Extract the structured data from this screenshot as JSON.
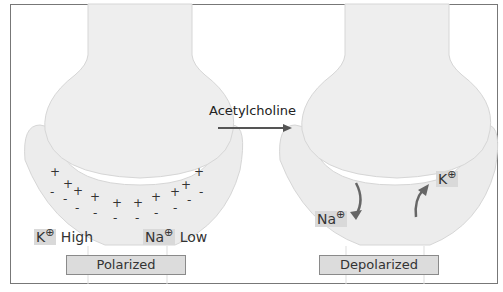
{
  "diagram": {
    "transmitter_label": "Acetylcholine",
    "left_panel": {
      "state": "Polarized",
      "ions": [
        {
          "symbol": "K",
          "charge": "⊕",
          "level": "High"
        },
        {
          "symbol": "Na",
          "charge": "⊕",
          "level": "Low"
        }
      ],
      "outer_charge": "+",
      "inner_charge": "-"
    },
    "right_panel": {
      "state": "Depolarized",
      "ions": [
        {
          "symbol": "Na",
          "charge": "⊕",
          "direction": "in"
        },
        {
          "symbol": "K",
          "charge": "⊕",
          "direction": "out"
        }
      ]
    },
    "colors": {
      "membrane_fill": "#ececec",
      "membrane_edge": "#d0d0d0",
      "arrow": "#666666",
      "box_fill": "#dcdcdc"
    }
  }
}
